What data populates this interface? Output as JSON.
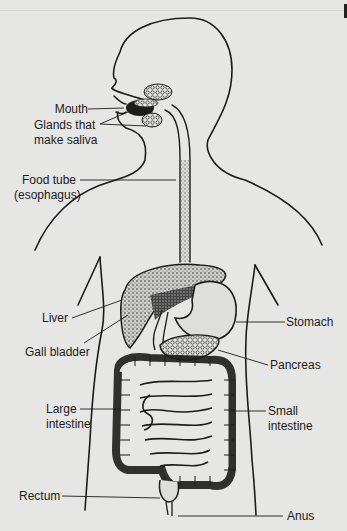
{
  "diagram": {
    "type": "labeled anatomical illustration",
    "background_color": "#e6e6e4",
    "ink_color": "#1c1c1c"
  },
  "labels": {
    "mouth": "Mouth",
    "glands_line1": "Glands that",
    "glands_line2": "make saliva",
    "food_tube_line1": "Food tube",
    "food_tube_line2": "(esophagus)",
    "liver": "Liver",
    "gall_bladder": "Gall bladder",
    "stomach": "Stomach",
    "pancreas": "Pancreas",
    "large_intestine_line1": "Large",
    "large_intestine_line2": "intestine",
    "small_intestine_line1": "Small",
    "small_intestine_line2": "intestine",
    "rectum": "Rectum",
    "anus": "Anus"
  }
}
